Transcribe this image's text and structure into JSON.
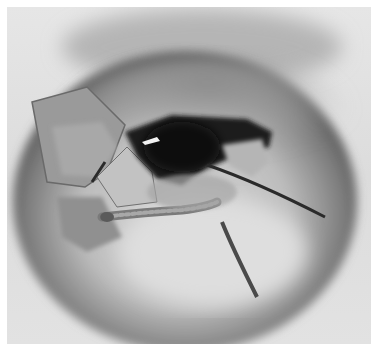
{
  "image": {
    "subject": "cracked seed with larva emerging",
    "colors": {
      "background": "#e2e2e2",
      "seed_shadow": "#5a5a5a",
      "seed_body": "#b8b8b8",
      "cavity": "#1e1e1e",
      "larva": "#8a8a8a",
      "border": "#ffffff"
    }
  }
}
